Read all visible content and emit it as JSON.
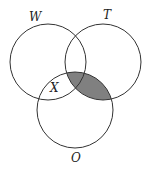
{
  "diagram": {
    "type": "venn",
    "sets": [
      {
        "id": "W",
        "label": "W",
        "cx": 48,
        "cy": 62,
        "r": 38
      },
      {
        "id": "T",
        "label": "T",
        "cx": 103,
        "cy": 62,
        "r": 38
      },
      {
        "id": "O",
        "label": "O",
        "cx": 75,
        "cy": 110,
        "r": 38
      }
    ],
    "region_labels": [
      {
        "label": "X",
        "region": "W ∩ O, outside T"
      }
    ],
    "shaded_region": "T ∩ O",
    "colors": {
      "stroke": "#333333",
      "shade": "#808080",
      "background": "#ffffff"
    }
  }
}
